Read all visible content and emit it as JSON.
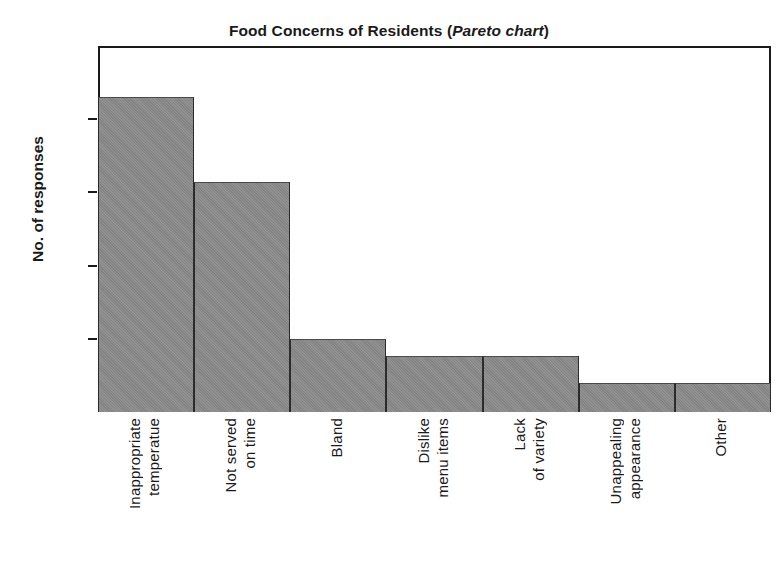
{
  "chart_data": {
    "type": "bar",
    "title": "Food Concerns of Residents (Pareto chart)",
    "title_main": "Food Concerns of Residents (",
    "title_emphasis": "Pareto chart",
    "title_close": ")",
    "xlabel": "",
    "ylabel": "No. of responses",
    "ylim": [
      0,
      25
    ],
    "ytick_labels": [
      "0",
      "5",
      "10",
      "15",
      "20",
      "25"
    ],
    "ytick_values": [
      0,
      5,
      10,
      15,
      20,
      25
    ],
    "grid": false,
    "legend": "none",
    "categories": [
      "Inappropriate temperatue",
      "Not served on time",
      "Bland",
      "Dislike menu items",
      "Lack of variety",
      "Unappealing appearance",
      "Other"
    ],
    "category_lines": [
      [
        "Inappropriate",
        "temperatue"
      ],
      [
        "Not served",
        "on time"
      ],
      [
        "Bland"
      ],
      [
        "Dislike",
        "menu items"
      ],
      [
        "Lack",
        "of variety"
      ],
      [
        "Unappealing",
        "appearance"
      ],
      [
        "Other"
      ]
    ],
    "values": [
      21.5,
      15.7,
      5,
      3.8,
      3.8,
      2,
      2
    ],
    "bar_color": "#8a8a8a",
    "axis_color": "#1a1a1a",
    "background_color": "#ffffff"
  }
}
